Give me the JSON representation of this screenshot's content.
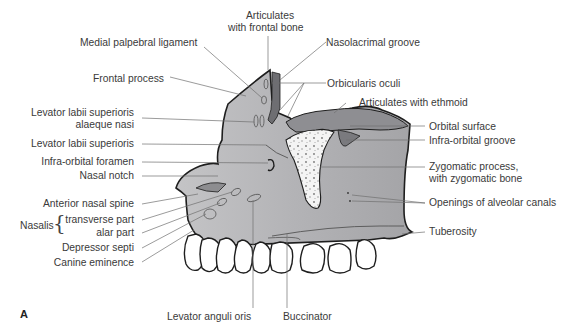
{
  "figure": {
    "panel_letter": "A",
    "colors": {
      "bone": "#b9b9bb",
      "bone_dark": "#8d8d90",
      "orbital": "#9a9a9d",
      "cancellous": "#f2f2f2",
      "teeth": "#ffffff",
      "outline": "#1e1e1e",
      "leader": "#666666"
    }
  },
  "labels": {
    "articulates_frontal_1": "Articulates",
    "articulates_frontal_2": "with frontal bone",
    "medial_palpebral": "Medial palpebral ligament",
    "nasolacrimal": "Nasolacrimal groove",
    "frontal_process": "Frontal process",
    "orbicularis": "Orbicularis oculi",
    "articulates_ethmoid": "Articulates with ethmoid",
    "llsan_1": "Levator labii superioris",
    "llsan_2": "alaeque nasi",
    "orbital_surface": "Orbital surface",
    "lls": "Levator labii superioris",
    "infraorbital_groove": "Infra-orbital groove",
    "infraorbital_foramen": "Infra-orbital foramen",
    "zygomatic_1": "Zygomatic process,",
    "zygomatic_2": "with zygomatic bone",
    "nasal_notch": "Nasal notch",
    "anterior_nasal_spine": "Anterior nasal spine",
    "alveolar_canals": "Openings of alveolar canals",
    "nasalis": "Nasalis",
    "transverse_part": "transverse part",
    "alar_part": "alar part",
    "tuberosity": "Tuberosity",
    "depressor_septi": "Depressor septi",
    "canine_eminence": "Canine eminence",
    "levator_anguli_oris": "Levator anguli oris",
    "buccinator": "Buccinator"
  }
}
